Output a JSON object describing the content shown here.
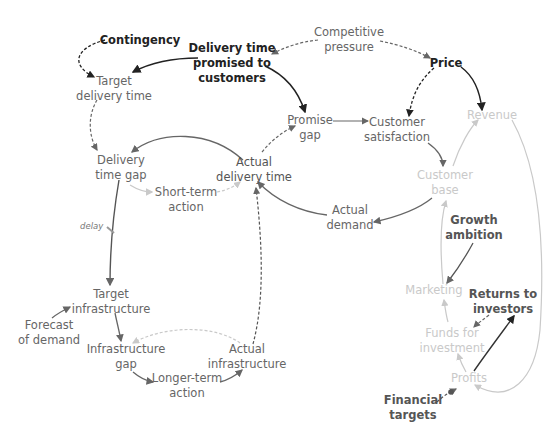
{
  "diagram": {
    "type": "causal-loop-diagram",
    "colors": {
      "dark": "#222222",
      "mid": "#666666",
      "light": "#c9c9c9"
    },
    "nodes": {
      "contingency": {
        "lines": [
          "Contingency"
        ]
      },
      "delivery_time_promised": {
        "lines": [
          "Delivery time",
          "promised to",
          "customers"
        ]
      },
      "competitive_pressure": {
        "lines": [
          "Competitive",
          "pressure"
        ]
      },
      "price": {
        "lines": [
          "Price"
        ]
      },
      "target_delivery_time": {
        "lines": [
          "Target",
          "delivery time"
        ]
      },
      "promise_gap": {
        "lines": [
          "Promise",
          "gap"
        ]
      },
      "customer_satisfaction": {
        "lines": [
          "Customer",
          "satisfaction"
        ]
      },
      "revenue": {
        "lines": [
          "Revenue"
        ]
      },
      "delivery_time_gap": {
        "lines": [
          "Delivery",
          "time gap"
        ]
      },
      "actual_delivery_time": {
        "lines": [
          "Actual",
          "delivery time"
        ]
      },
      "short_term_action": {
        "lines": [
          "Short-term",
          "action"
        ]
      },
      "customer_base": {
        "lines": [
          "Customer",
          "base"
        ]
      },
      "actual_demand": {
        "lines": [
          "Actual",
          "demand"
        ]
      },
      "growth_ambition": {
        "lines": [
          "Growth",
          "ambition"
        ]
      },
      "target_infrastructure": {
        "lines": [
          "Target",
          "infrastructure"
        ]
      },
      "marketing": {
        "lines": [
          "Marketing"
        ]
      },
      "returns_to_investors": {
        "lines": [
          "Returns to",
          "investors"
        ]
      },
      "forecast_of_demand": {
        "lines": [
          "Forecast",
          "of demand"
        ]
      },
      "funds_for_investment": {
        "lines": [
          "Funds for",
          "investment"
        ]
      },
      "infrastructure_gap": {
        "lines": [
          "Infrastructure",
          "gap"
        ]
      },
      "actual_infrastructure": {
        "lines": [
          "Actual",
          "infrastructure"
        ]
      },
      "profits": {
        "lines": [
          "Profits"
        ]
      },
      "longer_term_action": {
        "lines": [
          "Longer-term",
          "action"
        ]
      },
      "financial_targets": {
        "lines": [
          "Financial",
          "targets"
        ]
      }
    },
    "annotations": {
      "delay": "delay"
    }
  }
}
